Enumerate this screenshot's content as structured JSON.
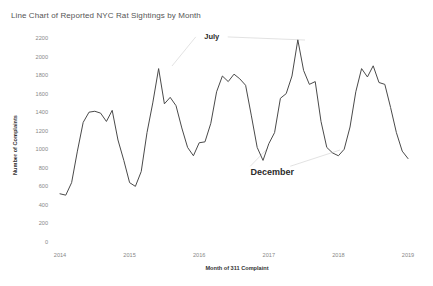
{
  "chart_data": {
    "type": "line",
    "title": "Line Chart of Reported NYC Rat Sightings by Month",
    "xlabel": "Month of 311 Complaint",
    "ylabel": "Number of Complaints",
    "ylim": [
      0,
      2200
    ],
    "yticks": [
      0,
      200,
      400,
      600,
      800,
      1000,
      1200,
      1400,
      1600,
      1800,
      2000,
      2200
    ],
    "ytick_labels": [
      "0",
      "200",
      "400",
      "600",
      "800",
      "1000",
      "1200",
      "1400",
      "1600",
      "1800",
      "2000",
      "2200"
    ],
    "xticks": [
      2014,
      2015,
      2016,
      2017,
      2018,
      2019
    ],
    "xtick_labels": [
      "2014",
      "2015",
      "2016",
      "2017",
      "2018",
      "2019"
    ],
    "grid": false,
    "legend": false,
    "line_color": "#4a4a4a",
    "annotations": [
      {
        "text": "July",
        "x": 2016.18,
        "y": 2190
      },
      {
        "text": "December",
        "x": 2017.05,
        "y": 720
      }
    ],
    "series": [
      {
        "name": "Rat Sightings",
        "x": [
          2014.0,
          2014.083,
          2014.167,
          2014.25,
          2014.333,
          2014.417,
          2014.5,
          2014.583,
          2014.667,
          2014.75,
          2014.833,
          2014.917,
          2015.0,
          2015.083,
          2015.167,
          2015.25,
          2015.333,
          2015.417,
          2015.5,
          2015.583,
          2015.667,
          2015.75,
          2015.833,
          2015.917,
          2016.0,
          2016.083,
          2016.167,
          2016.25,
          2016.333,
          2016.417,
          2016.5,
          2016.583,
          2016.667,
          2016.75,
          2016.833,
          2016.917,
          2017.0,
          2017.083,
          2017.167,
          2017.25,
          2017.333,
          2017.417,
          2017.5,
          2017.583,
          2017.667,
          2017.75,
          2017.833,
          2017.917,
          2018.0,
          2018.083,
          2018.167,
          2018.25,
          2018.333,
          2018.417,
          2018.5,
          2018.583,
          2018.667,
          2018.75,
          2018.833,
          2018.917,
          2019.0
        ],
        "values": [
          520,
          505,
          640,
          980,
          1290,
          1400,
          1410,
          1390,
          1300,
          1420,
          1100,
          880,
          640,
          600,
          760,
          1180,
          1500,
          1870,
          1490,
          1560,
          1470,
          1230,
          1020,
          930,
          1070,
          1080,
          1280,
          1620,
          1790,
          1730,
          1810,
          1760,
          1690,
          1360,
          1020,
          880,
          1060,
          1180,
          1550,
          1600,
          1790,
          2180,
          1850,
          1700,
          1730,
          1300,
          1020,
          960,
          930,
          1000,
          1240,
          1620,
          1870,
          1780,
          1900,
          1720,
          1700,
          1450,
          1180,
          980,
          900
        ]
      }
    ]
  }
}
